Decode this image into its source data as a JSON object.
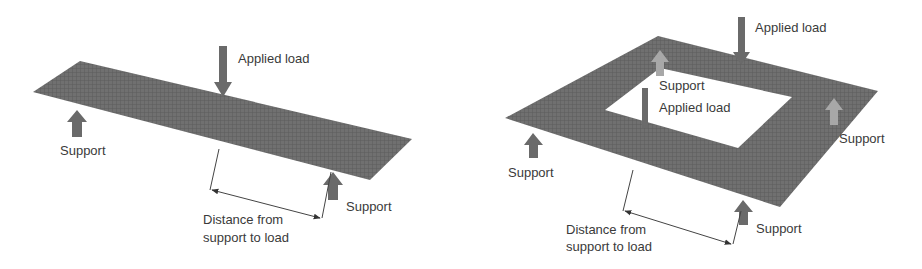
{
  "figure": {
    "left_panel": {
      "title": "one-way-slab",
      "labels": {
        "applied_load": "Applied load",
        "support_left": "Support",
        "support_right": "Support",
        "distance_line1": "Distance from",
        "distance_line2": "support to load"
      }
    },
    "right_panel": {
      "title": "two-way-frame",
      "labels": {
        "applied_load_top": "Applied load",
        "support_inner": "Support",
        "applied_load_inner": "Applied load",
        "support_right": "Support",
        "support_left": "Support",
        "support_bottom": "Support",
        "distance_line1": "Distance from",
        "distance_line2": "support to load"
      }
    },
    "colors": {
      "slab": "#6e6e6e",
      "slab_dark": "#5a5a5a",
      "arrow_dark": "#6a6a6a",
      "arrow_light": "#a8a8a8",
      "text": "#3a3a3a",
      "line": "#444444"
    }
  }
}
